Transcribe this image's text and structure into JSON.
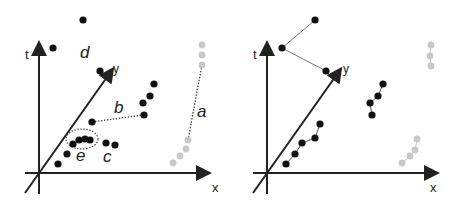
{
  "colors": {
    "dark": "#111111",
    "light": "#c8c8c8",
    "axis": "#222222",
    "link": "#777777"
  },
  "axes": {
    "t": "t",
    "x": "x",
    "y": "y"
  },
  "left_panel": {
    "labels": {
      "a": "a",
      "b": "b",
      "c": "c",
      "d": "d",
      "e": "e"
    },
    "points_dark": [
      [
        83,
        20
      ],
      [
        53,
        48
      ],
      [
        100,
        71
      ],
      [
        154,
        84
      ],
      [
        150,
        96
      ],
      [
        143,
        103
      ],
      [
        144,
        115
      ],
      [
        92,
        122
      ],
      [
        73,
        144
      ],
      [
        79,
        140
      ],
      [
        85,
        139
      ],
      [
        90,
        140
      ],
      [
        67,
        154
      ],
      [
        58,
        164
      ],
      [
        106,
        143
      ],
      [
        115,
        145
      ]
    ],
    "points_light": [
      [
        202,
        45
      ],
      [
        202,
        55
      ],
      [
        202,
        65
      ],
      [
        188,
        140
      ],
      [
        186,
        149
      ],
      [
        180,
        156
      ],
      [
        173,
        163
      ]
    ]
  },
  "right_panel": {
    "points_dark": [
      [
        85,
        20
      ],
      [
        52,
        48
      ],
      [
        96,
        71
      ],
      [
        153,
        84
      ],
      [
        148,
        96
      ],
      [
        140,
        103
      ],
      [
        142,
        115
      ],
      [
        90,
        124
      ],
      [
        85,
        138
      ],
      [
        72,
        143
      ],
      [
        65,
        154
      ],
      [
        56,
        164
      ]
    ],
    "points_light": [
      [
        201,
        45
      ],
      [
        200,
        56
      ],
      [
        201,
        66
      ],
      [
        187,
        139
      ],
      [
        185,
        150
      ],
      [
        180,
        156
      ],
      [
        172,
        163
      ]
    ]
  }
}
